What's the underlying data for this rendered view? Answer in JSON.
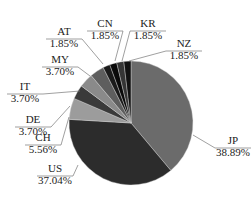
{
  "chart_data": {
    "type": "pie",
    "title": "",
    "start_angle_deg": 0,
    "direction": "clockwise",
    "center": [
      131,
      123
    ],
    "radius": 62,
    "slices": [
      {
        "label": "JP",
        "value": 38.89,
        "display": "38.89%",
        "color": "#6b6b6b",
        "label_pos": [
          233,
          145
        ],
        "anchor": [
          193,
          135
        ]
      },
      {
        "label": "US",
        "value": 37.04,
        "display": "37.04%",
        "color": "#2c2c2c",
        "label_pos": [
          55,
          173
        ],
        "anchor": [
          78,
          165
        ]
      },
      {
        "label": "CH",
        "value": 5.56,
        "display": "5.56%",
        "color": "#9c9c9c",
        "label_pos": [
          43,
          142
        ],
        "anchor": [
          69,
          117
        ]
      },
      {
        "label": "DE",
        "value": 3.7,
        "display": "3.70%",
        "color": "#3a3a3a",
        "label_pos": [
          33,
          124
        ],
        "anchor": [
          70,
          106
        ]
      },
      {
        "label": "IT",
        "value": 3.7,
        "display": "3.70%",
        "color": "#8a8a8a",
        "label_pos": [
          25,
          91
        ],
        "anchor": [
          80,
          91
        ]
      },
      {
        "label": "MY",
        "value": 3.7,
        "display": "3.70%",
        "color": "#5e5e5e",
        "label_pos": [
          60,
          64
        ],
        "anchor": [
          90,
          76
        ]
      },
      {
        "label": "AT",
        "value": 1.85,
        "display": "1.85%",
        "color": "#1a1a1a",
        "label_pos": [
          64,
          36
        ],
        "anchor": [
          103,
          64
        ]
      },
      {
        "label": "CN",
        "value": 1.85,
        "display": "1.85%",
        "color": "#0a0a0a",
        "label_pos": [
          105,
          28
        ],
        "anchor": [
          115,
          61
        ]
      },
      {
        "label": "KR",
        "value": 1.85,
        "display": "1.85%",
        "color": "#353535",
        "label_pos": [
          148,
          28
        ],
        "anchor": [
          122,
          61
        ]
      },
      {
        "label": "NZ",
        "value": 1.85,
        "display": "1.85%",
        "color": "#111111",
        "label_pos": [
          184,
          48
        ],
        "anchor": [
          129,
          61
        ]
      }
    ]
  }
}
